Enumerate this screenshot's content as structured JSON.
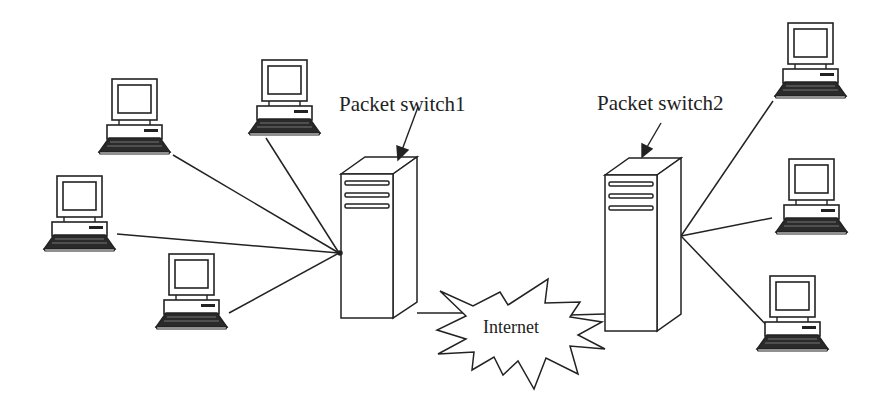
{
  "diagram": {
    "type": "network-topology",
    "stroke_color": "#222222",
    "background": "#ffffff",
    "nodes": {
      "switch1": {
        "label": "Packet switch1",
        "kind": "server-tower"
      },
      "switch2": {
        "label": "Packet switch2",
        "kind": "server-tower"
      },
      "internet": {
        "label": "Internet",
        "kind": "cloud-burst"
      },
      "left_computers": [
        {
          "id": "pc-left-1",
          "kind": "desktop-computer"
        },
        {
          "id": "pc-left-2",
          "kind": "desktop-computer"
        },
        {
          "id": "pc-left-3",
          "kind": "desktop-computer"
        },
        {
          "id": "pc-left-4",
          "kind": "desktop-computer"
        }
      ],
      "right_computers": [
        {
          "id": "pc-right-1",
          "kind": "desktop-computer"
        },
        {
          "id": "pc-right-2",
          "kind": "desktop-computer"
        },
        {
          "id": "pc-right-3",
          "kind": "desktop-computer"
        }
      ]
    },
    "edges": [
      [
        "pc-left-1",
        "switch1"
      ],
      [
        "pc-left-2",
        "switch1"
      ],
      [
        "pc-left-3",
        "switch1"
      ],
      [
        "pc-left-4",
        "switch1"
      ],
      [
        "switch1",
        "internet"
      ],
      [
        "internet",
        "switch2"
      ],
      [
        "switch2",
        "pc-right-1"
      ],
      [
        "switch2",
        "pc-right-2"
      ],
      [
        "switch2",
        "pc-right-3"
      ]
    ]
  }
}
